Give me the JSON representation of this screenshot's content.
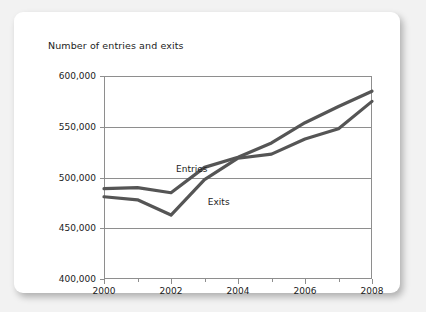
{
  "card": {
    "title": "Number of entries and exits"
  },
  "chart_data": {
    "type": "line",
    "title": "Number of entries and exits",
    "xlabel": "",
    "ylabel": "",
    "x": [
      2000,
      2001,
      2002,
      2003,
      2004,
      2005,
      2006,
      2007,
      2008
    ],
    "categories": [
      "2000",
      "2001",
      "2002",
      "2003",
      "2004",
      "2005",
      "2006",
      "2007",
      "2008"
    ],
    "series": [
      {
        "name": "Entries",
        "values": [
          489000,
          490000,
          485000,
          510000,
          520000,
          534000,
          554000,
          570000,
          585000
        ],
        "color": "#555555"
      },
      {
        "name": "Exits",
        "values": [
          481000,
          478000,
          463000,
          498000,
          519000,
          523000,
          538000,
          548000,
          575000
        ],
        "color": "#555555"
      }
    ],
    "ylim": [
      400000,
      600000
    ],
    "ytick_values": [
      600000,
      550000,
      500000,
      450000,
      400000
    ],
    "ytick_labels": [
      "600,000",
      "550,000",
      "500,000",
      "450,000",
      "400,000"
    ],
    "xlim": [
      2000,
      2008
    ],
    "xtick_values": [
      2000,
      2002,
      2004,
      2006,
      2008
    ],
    "xtick_labels": [
      "2000",
      "2002",
      "2004",
      "2006",
      "2008"
    ],
    "xminor_ticks": [
      2001,
      2003,
      2005,
      2007
    ],
    "grid": true,
    "legend_position": "inline-annotations",
    "annotations": [
      {
        "text": "Entries",
        "x": 2002.15,
        "y": 513000
      },
      {
        "text": "Exits",
        "x": 2003.1,
        "y": 481000
      }
    ]
  }
}
